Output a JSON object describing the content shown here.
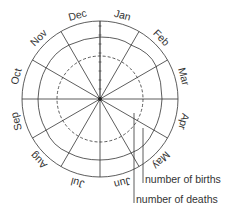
{
  "diagram": {
    "type": "polar-month-chart",
    "months": [
      "Jan",
      "Feb",
      "Mar",
      "Apr",
      "May",
      "Jun",
      "Jul",
      "Aug",
      "Sep",
      "Oct",
      "Nov",
      "Dec"
    ],
    "legend": {
      "births": "number of births",
      "deaths": "number of deaths"
    },
    "colors": {
      "line": "#333333",
      "background": "#ffffff"
    }
  }
}
